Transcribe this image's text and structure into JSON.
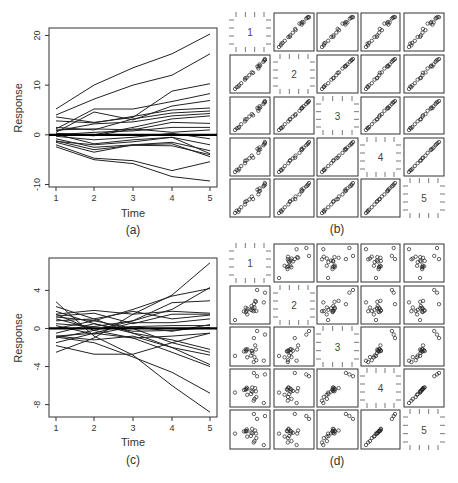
{
  "figure": {
    "panels": [
      "(a)",
      "(b)",
      "(c)",
      "(d)"
    ]
  },
  "chart_data": [
    {
      "id": "a",
      "type": "line",
      "title": "",
      "panel_label": "(a)",
      "xlabel": "Time",
      "ylabel": "Response",
      "x": [
        1,
        2,
        3,
        4,
        5
      ],
      "xticks": [
        "1",
        "2",
        "3",
        "4",
        "5"
      ],
      "yticks": [
        -10,
        0,
        10,
        20
      ],
      "ytick_labels": [
        "-10",
        "0",
        "10",
        "20"
      ],
      "ylim": [
        -10.5,
        21.5
      ],
      "reference_line": 0,
      "grid": false,
      "series": [
        {
          "name": "s1",
          "values": [
            5.2,
            10.0,
            13.5,
            16.3,
            20.3
          ]
        },
        {
          "name": "s2",
          "values": [
            4.0,
            7.2,
            10.0,
            12.0,
            16.3
          ]
        },
        {
          "name": "s3",
          "values": [
            3.6,
            2.5,
            3.5,
            8.8,
            10.3
          ]
        },
        {
          "name": "s4",
          "values": [
            1.2,
            5.2,
            5.2,
            6.7,
            8.3
          ]
        },
        {
          "name": "s5",
          "values": [
            0.5,
            4.6,
            3.0,
            5.8,
            6.9
          ]
        },
        {
          "name": "s6",
          "values": [
            2.8,
            2.4,
            3.7,
            5.0,
            5.4
          ]
        },
        {
          "name": "s7",
          "values": [
            1.5,
            1.0,
            3.2,
            4.4,
            4.8
          ]
        },
        {
          "name": "s8",
          "values": [
            0.8,
            2.2,
            2.6,
            3.8,
            4.3
          ]
        },
        {
          "name": "s9",
          "values": [
            0.2,
            0.0,
            1.5,
            3.2,
            3.8
          ]
        },
        {
          "name": "s10",
          "values": [
            1.0,
            1.2,
            1.0,
            2.5,
            2.3
          ]
        },
        {
          "name": "s11",
          "values": [
            0.0,
            0.5,
            0.8,
            1.5,
            1.5
          ]
        },
        {
          "name": "s12",
          "values": [
            0.3,
            -0.2,
            1.2,
            0.5,
            1.0
          ]
        },
        {
          "name": "s13",
          "values": [
            -0.3,
            -1.0,
            -0.5,
            0.3,
            -0.8
          ]
        },
        {
          "name": "s14",
          "values": [
            0.1,
            -1.8,
            -1.0,
            -0.5,
            -2.0
          ]
        },
        {
          "name": "s15",
          "values": [
            -0.8,
            -2.5,
            -2.0,
            -1.5,
            -3.2
          ]
        },
        {
          "name": "s16",
          "values": [
            -1.2,
            -3.0,
            -2.1,
            -2.2,
            -4.0
          ]
        },
        {
          "name": "s17",
          "values": [
            -1.5,
            -3.5,
            -2.0,
            -1.8,
            -4.4
          ]
        },
        {
          "name": "s18",
          "values": [
            -1.3,
            -2.0,
            -1.4,
            -0.5,
            -3.8
          ]
        },
        {
          "name": "s19",
          "values": [
            -2.0,
            -4.7,
            -5.2,
            -7.2,
            -5.4
          ]
        },
        {
          "name": "s20",
          "values": [
            -2.4,
            -5.0,
            -5.8,
            -8.4,
            -9.3
          ]
        }
      ]
    },
    {
      "id": "b",
      "type": "scatter",
      "title": "",
      "panel_label": "(b)",
      "layout": "scatterplot-matrix 5x5",
      "variables": [
        "1",
        "2",
        "3",
        "4",
        "5"
      ],
      "description": "Pairwise scatterplots of responses at times 1-5 for data in (a); strong positive linear association in all panels",
      "n_points": 20,
      "correlation_hint": [
        [
          1,
          0.9,
          0.85,
          0.8,
          0.75
        ],
        [
          0.9,
          1,
          0.95,
          0.92,
          0.9
        ],
        [
          0.85,
          0.95,
          1,
          0.96,
          0.93
        ],
        [
          0.8,
          0.92,
          0.96,
          1,
          0.98
        ],
        [
          0.75,
          0.9,
          0.93,
          0.98,
          1
        ]
      ]
    },
    {
      "id": "c",
      "type": "line",
      "title": "",
      "panel_label": "(c)",
      "xlabel": "Time",
      "ylabel": "Response",
      "x": [
        1,
        2,
        3,
        4,
        5
      ],
      "xticks": [
        "1",
        "2",
        "3",
        "4",
        "5"
      ],
      "yticks": [
        -8,
        -4,
        0,
        4
      ],
      "ytick_labels": [
        "-8",
        "-4",
        "0",
        "4"
      ],
      "ylim": [
        -9.3,
        7.4
      ],
      "reference_line": 0,
      "grid": false,
      "series": [
        {
          "name": "s1",
          "values": [
            -2.5,
            -1.0,
            1.5,
            3.5,
            6.9
          ]
        },
        {
          "name": "s2",
          "values": [
            -1.0,
            -0.2,
            0.8,
            2.0,
            4.3
          ]
        },
        {
          "name": "s3",
          "values": [
            0.0,
            0.8,
            2.0,
            3.4,
            4.2
          ]
        },
        {
          "name": "s4",
          "values": [
            0.5,
            0.2,
            0.8,
            2.7,
            2.9
          ]
        },
        {
          "name": "s5",
          "values": [
            1.5,
            1.9,
            1.5,
            1.8,
            1.6
          ]
        },
        {
          "name": "s6",
          "values": [
            1.3,
            1.6,
            0.5,
            1.5,
            1.5
          ]
        },
        {
          "name": "s7",
          "values": [
            0.8,
            1.0,
            1.8,
            1.0,
            1.4
          ]
        },
        {
          "name": "s8",
          "values": [
            -0.8,
            -0.5,
            0.6,
            0.6,
            1.0
          ]
        },
        {
          "name": "s9",
          "values": [
            1.0,
            0.0,
            0.2,
            0.3,
            0.3
          ]
        },
        {
          "name": "s10",
          "values": [
            -0.5,
            0.5,
            -0.3,
            -0.2,
            0.1
          ]
        },
        {
          "name": "s11",
          "values": [
            -1.5,
            -0.5,
            -1.0,
            -0.8,
            -0.5
          ]
        },
        {
          "name": "s12",
          "values": [
            -1.8,
            -2.7,
            -2.7,
            -1.5,
            -0.5
          ]
        },
        {
          "name": "s13",
          "values": [
            1.8,
            0.5,
            -0.5,
            -1.2,
            -2.2
          ]
        },
        {
          "name": "s14",
          "values": [
            1.2,
            0.8,
            0.0,
            -1.5,
            -2.5
          ]
        },
        {
          "name": "s15",
          "values": [
            -0.8,
            -1.2,
            -0.8,
            -2.0,
            -2.8
          ]
        },
        {
          "name": "s16",
          "values": [
            2.3,
            1.0,
            -0.5,
            -2.0,
            -3.8
          ]
        },
        {
          "name": "s17",
          "values": [
            1.5,
            -0.2,
            -1.0,
            -2.5,
            -4.0
          ]
        },
        {
          "name": "s18",
          "values": [
            -0.9,
            -1.5,
            -3.0,
            -4.6,
            -6.8
          ]
        },
        {
          "name": "s19",
          "values": [
            2.8,
            -0.8,
            -2.8,
            -6.0,
            -8.8
          ]
        },
        {
          "name": "s20",
          "values": [
            0.3,
            -0.6,
            0.2,
            -0.3,
            0.4
          ]
        }
      ]
    },
    {
      "id": "d",
      "type": "scatter",
      "title": "",
      "panel_label": "(d)",
      "layout": "scatterplot-matrix 5x5",
      "variables": [
        "1",
        "2",
        "3",
        "4",
        "5"
      ],
      "description": "Pairwise scatterplots of responses at times 1-5 for data in (c); weak association between distant times, strong between adjacent late times (4,5), negative between time 1 and times 4-5",
      "n_points": 20,
      "correlation_hint": [
        [
          1,
          0.5,
          0.0,
          -0.6,
          -0.7
        ],
        [
          0.5,
          1,
          0.6,
          0.1,
          -0.1
        ],
        [
          0.0,
          0.6,
          1,
          0.7,
          0.6
        ],
        [
          -0.6,
          0.1,
          0.7,
          1,
          0.95
        ],
        [
          -0.7,
          -0.1,
          0.6,
          0.95,
          1
        ]
      ]
    }
  ]
}
